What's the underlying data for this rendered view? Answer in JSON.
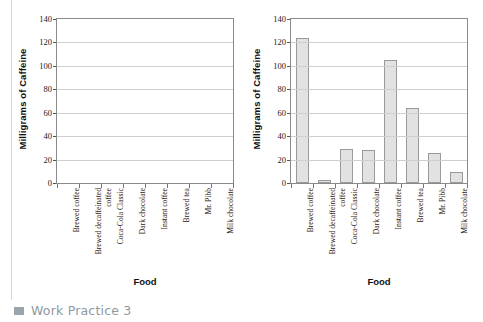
{
  "page": {
    "footer": {
      "bullet_icon": "square-bullet-icon",
      "label": "Work Practice 3",
      "color": "#8e99a3"
    }
  },
  "chart_data": [
    {
      "id": "left-blank-chart",
      "type": "bar",
      "title": "",
      "xlabel": "Food",
      "ylabel": "Milligrams of Caffeine",
      "categories": [
        "Brewed coffee",
        "Brewed decaffeinated coffee",
        "Coca-Cola Classic",
        "Dark chocolate",
        "Instant coffee",
        "Brewed tea",
        "Mr. Pibb",
        "Milk chocolate"
      ],
      "values": [
        0,
        0,
        0,
        0,
        0,
        0,
        0,
        0
      ],
      "yticks": [
        0,
        20,
        40,
        60,
        80,
        100,
        120,
        140
      ],
      "ylim": [
        0,
        140
      ],
      "grid": true,
      "legend": "none",
      "bar_color": "#e2e2e2",
      "bar_border_color": "#9a9a9a"
    },
    {
      "id": "right-filled-chart",
      "type": "bar",
      "title": "",
      "xlabel": "Food",
      "ylabel": "Milligrams of Caffeine",
      "categories": [
        "Brewed coffee",
        "Brewed decaffeinated coffee",
        "Coca-Cola Classic",
        "Dark chocolate",
        "Instant coffee",
        "Brewed tea",
        "Mr. Pibb",
        "Milk chocolate"
      ],
      "values": [
        124,
        3,
        29,
        28,
        105,
        64,
        26,
        9
      ],
      "yticks": [
        0,
        20,
        40,
        60,
        80,
        100,
        120,
        140
      ],
      "ylim": [
        0,
        140
      ],
      "grid": true,
      "legend": "none",
      "bar_color": "#e2e2e2",
      "bar_border_color": "#9a9a9a"
    }
  ]
}
